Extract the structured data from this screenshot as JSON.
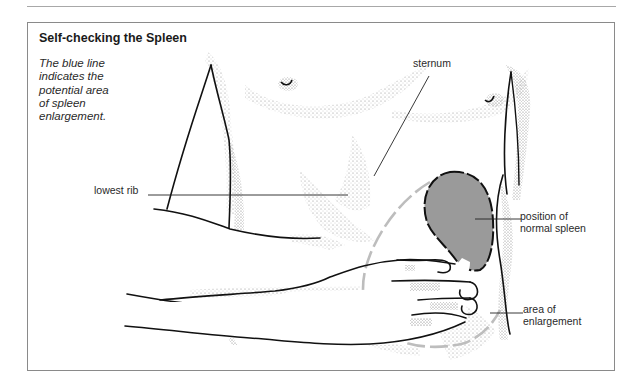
{
  "figure": {
    "title": "Self-checking the Spleen",
    "caption_lines": [
      "The blue line",
      "indicates the",
      "potential area",
      "of spleen",
      "enlargement."
    ],
    "labels": {
      "sternum": "sternum",
      "lowest_rib": "lowest rib",
      "normal_spleen_lines": [
        "position of",
        "normal spleen"
      ],
      "enlargement_lines": [
        "area of",
        "enlargement"
      ]
    },
    "colors": {
      "spleen_fill": "#9a9a9a",
      "enlargement_outline": "#bdbdbd",
      "line_art": "#111111",
      "stipple": "#8a8a8a",
      "frame": "#8a8a8a"
    }
  }
}
